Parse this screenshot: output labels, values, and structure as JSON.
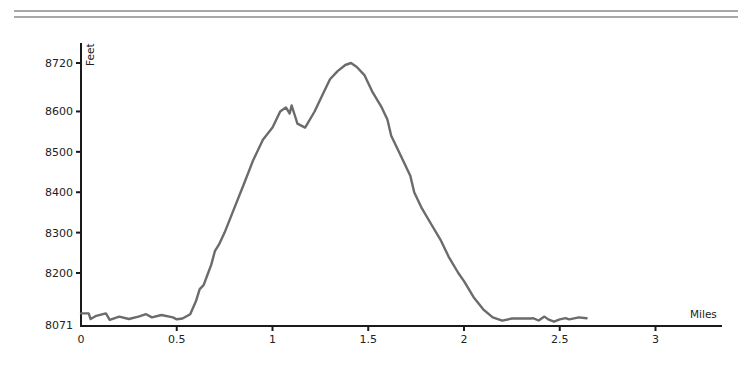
{
  "page": {
    "rule_color": "#a8a8a8",
    "line_color": "#6b6b6b",
    "axis_color": "#1a1a1a"
  },
  "chart_data": {
    "type": "line",
    "title": "",
    "xlabel": "Miles",
    "ylabel": "Feet",
    "xlim": [
      0,
      3.35
    ],
    "ylim": [
      8071,
      8745
    ],
    "grid": false,
    "legend": null,
    "x_ticks": [
      0,
      0.5,
      1,
      1.5,
      2,
      2.5,
      3
    ],
    "x_tick_labels": [
      "0",
      "0.5",
      "1",
      "1.5",
      "2",
      "2.5",
      "3"
    ],
    "y_ticks": [
      8071,
      8200,
      8300,
      8400,
      8500,
      8600,
      8720
    ],
    "y_tick_labels": [
      "8071",
      "8200",
      "8300",
      "8400",
      "8500",
      "8600",
      "8720"
    ],
    "series": [
      {
        "name": "Elevation",
        "x": [
          0.0,
          0.04,
          0.05,
          0.08,
          0.13,
          0.15,
          0.2,
          0.25,
          0.3,
          0.34,
          0.37,
          0.42,
          0.48,
          0.5,
          0.53,
          0.57,
          0.6,
          0.62,
          0.64,
          0.66,
          0.68,
          0.7,
          0.72,
          0.75,
          0.8,
          0.85,
          0.9,
          0.95,
          1.0,
          1.04,
          1.07,
          1.09,
          1.1,
          1.12,
          1.13,
          1.17,
          1.22,
          1.26,
          1.3,
          1.34,
          1.38,
          1.41,
          1.44,
          1.48,
          1.52,
          1.57,
          1.6,
          1.62,
          1.66,
          1.72,
          1.74,
          1.78,
          1.83,
          1.88,
          1.92,
          1.97,
          2.0,
          2.05,
          2.1,
          2.15,
          2.2,
          2.25,
          2.35,
          2.36,
          2.39,
          2.42,
          2.44,
          2.47,
          2.5,
          2.53,
          2.55,
          2.6,
          2.64
        ],
        "values": [
          8100,
          8100,
          8086,
          8094,
          8100,
          8084,
          8092,
          8086,
          8092,
          8098,
          8090,
          8096,
          8090,
          8078,
          8080,
          8098,
          8130,
          8160,
          8170,
          8195,
          8220,
          8255,
          8270,
          8300,
          8360,
          8420,
          8480,
          8530,
          8560,
          8600,
          8610,
          8595,
          8615,
          8585,
          8570,
          8560,
          8600,
          8640,
          8680,
          8700,
          8715,
          8720,
          8710,
          8690,
          8650,
          8610,
          8580,
          8540,
          8500,
          8440,
          8400,
          8360,
          8320,
          8280,
          8240,
          8200,
          8180,
          8140,
          8110,
          8090,
          8082,
          8080,
          8080,
          8088,
          8075,
          8092,
          8085,
          8072,
          8085,
          8088,
          8085,
          8090,
          8088
        ]
      }
    ]
  }
}
